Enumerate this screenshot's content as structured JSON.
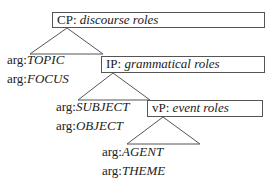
{
  "diagram": {
    "nodes": [
      {
        "id": "cp",
        "label": "CP",
        "sep": ": ",
        "desc": "discourse roles"
      },
      {
        "id": "ip",
        "label": "IP",
        "sep": ": ",
        "desc": "grammatical roles"
      },
      {
        "id": "vp",
        "label": "vP",
        "sep": ": ",
        "desc": "event roles"
      }
    ],
    "args": {
      "cp": [
        {
          "prefix": "arg:",
          "role": "TOPIC"
        },
        {
          "prefix": "arg:",
          "role": "FOCUS"
        }
      ],
      "ip": [
        {
          "prefix": "arg:",
          "role": "SUBJECT"
        },
        {
          "prefix": "arg:",
          "role": "OBJECT"
        }
      ],
      "vp": [
        {
          "prefix": "arg:",
          "role": "AGENT"
        },
        {
          "prefix": "arg:",
          "role": "THEME"
        }
      ]
    },
    "colors": {
      "line": "#555555",
      "text": "#222222",
      "background": "#ffffff"
    }
  }
}
